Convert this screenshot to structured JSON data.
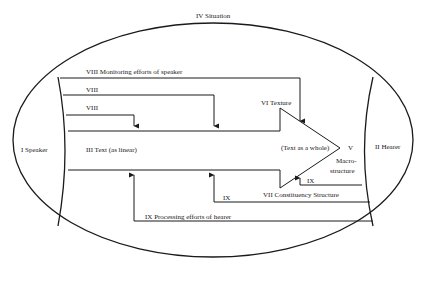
{
  "diagram": {
    "situation_label": "IV Situation",
    "speaker_label": "I Speaker",
    "hearer_label": "II Hearer",
    "text_linear_label": "III Text (as linear)",
    "text_whole_label": "(Text as a whole)",
    "macro_label_v": "V",
    "macro_label_1": "Macro-",
    "macro_label_2": "structure",
    "texture_label": "VI Texture",
    "constituency_label": "VII Constituency Structure",
    "monitoring_label": "VIII Monitoring efforts of speaker",
    "viii_label_2": "VIII",
    "viii_label_3": "VIII",
    "processing_label": "IX Processing efforts of hearer",
    "ix_label_2": "IX",
    "ix_label_3": "IX"
  }
}
